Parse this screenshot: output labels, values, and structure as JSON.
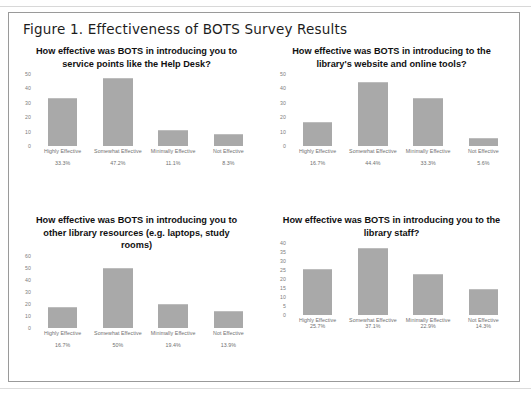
{
  "figure": {
    "caption": "Figure 1. Effectiveness of BOTS Survey Results"
  },
  "colors": {
    "bar": "#a9a9a9",
    "frame": "#9a9a9a",
    "axis_text": "#7d7d7d",
    "title_text": "#111111"
  },
  "chart_data": [
    {
      "type": "bar",
      "title": "How effective was BOTS in introducing you to service points like the Help Desk?",
      "categories": [
        "Highly Effective",
        "Somewhat Effective",
        "Minimally Effective",
        "Not Effective"
      ],
      "values": [
        33.3,
        47.2,
        11.1,
        8.3
      ],
      "value_labels": [
        "33.3%",
        "47.2%",
        "11.1%",
        "8.3%"
      ],
      "yticks": [
        50,
        40,
        30,
        20,
        10,
        0
      ],
      "ylim": [
        0,
        50
      ],
      "xlabel": "",
      "ylabel": "",
      "grid": false,
      "legend": false
    },
    {
      "type": "bar",
      "title": "How effective was BOTS in introducing to the library's website and online tools?",
      "categories": [
        "Highly Effective",
        "Somewhat Effective",
        "Minimally Effective",
        "Not Effective"
      ],
      "values": [
        16.7,
        44.4,
        33.3,
        5.6
      ],
      "value_labels": [
        "16.7%",
        "44.4%",
        "33.3%",
        "5.6%"
      ],
      "yticks": [
        50,
        40,
        30,
        20,
        10,
        0
      ],
      "ylim": [
        0,
        50
      ],
      "xlabel": "",
      "ylabel": "",
      "grid": false,
      "legend": false
    },
    {
      "type": "bar",
      "title": "How effective was BOTS in introducing you to other library resources (e.g. laptops, study rooms)",
      "categories": [
        "Highly Effective",
        "Somewhat Effective",
        "Minimally Effective",
        "Not Effective"
      ],
      "values": [
        16.7,
        50,
        19.4,
        13.9
      ],
      "value_labels": [
        "16.7%",
        "50%",
        "19.4%",
        "13.9%"
      ],
      "yticks": [
        60,
        50,
        40,
        30,
        20,
        10,
        0
      ],
      "ylim": [
        0,
        60
      ],
      "xlabel": "",
      "ylabel": "",
      "grid": false,
      "legend": false
    },
    {
      "type": "bar",
      "title": "How effective was BOTS in introducing you to the library staff?",
      "categories": [
        "Highly Effective",
        "Somewhat Effective",
        "Minimally Effective",
        "Not Effective"
      ],
      "values": [
        25.7,
        37.1,
        22.9,
        14.3
      ],
      "value_labels": [
        "25.7%",
        "37.1%",
        "22.9%",
        "14.3%"
      ],
      "yticks": [
        40,
        35,
        30,
        25,
        20,
        15,
        10,
        5,
        0
      ],
      "ylim": [
        0,
        40
      ],
      "xlabel": "",
      "ylabel": "",
      "grid": false,
      "legend": false
    }
  ]
}
